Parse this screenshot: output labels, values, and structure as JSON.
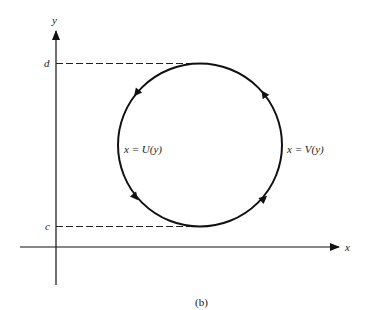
{
  "figure": {
    "caption": "(b)",
    "axes": {
      "x_label": "x",
      "y_label": "y"
    },
    "levels": {
      "upper_label": "d",
      "lower_label": "c"
    },
    "curves": {
      "left_label": "x = U(y)",
      "right_label": "x = V(y)"
    },
    "orientation": "counterclockwise",
    "colors": {
      "stroke": "#111111",
      "background": "#ffffff"
    }
  }
}
